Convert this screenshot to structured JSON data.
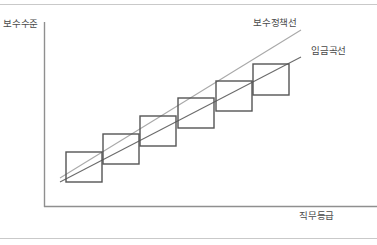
{
  "figure": {
    "axes": {
      "y_axis_title": "보수수준",
      "x_axis_title": "직무등급"
    },
    "annotations": {
      "policy_line_label": "보수정책선",
      "wage_curve_label": "임금곡선"
    },
    "colors": {
      "axis": "#8f8f8f",
      "policy_line": "#a9a9a9",
      "wage_curve": "#6b6b6b",
      "grade_box": "#555555",
      "page_rule": "#c9c9c9",
      "text": "#4a4a4a",
      "background": "#ffffff"
    }
  },
  "chart_data": {
    "type": "scatter",
    "title": "",
    "xlabel": "직무등급",
    "ylabel": "보수수준",
    "grid": false,
    "legend_position": "inline-annotation",
    "xlim": [
      0,
      10
    ],
    "ylim": [
      0,
      10
    ],
    "annotations": [
      "보수정책선",
      "임금곡선"
    ],
    "series": [
      {
        "name": "보수정책선",
        "type": "line",
        "color": "#a9a9a9",
        "x": [
          0.55,
          8.65
        ],
        "y": [
          2.05,
          8.55
        ],
        "pixel_endpoints": [
          [
            60,
            178
          ],
          [
            301,
            30
          ]
        ]
      },
      {
        "name": "임금곡선",
        "type": "line",
        "color": "#6b6b6b",
        "x": [
          0.55,
          8.65
        ],
        "y": [
          1.55,
          7.3
        ],
        "pixel_endpoints": [
          [
            60,
            182
          ],
          [
            301,
            57
          ]
        ]
      },
      {
        "name": "직무등급 보수범위 (grade pay ranges)",
        "type": "boxes",
        "color": "#555555",
        "boxes": [
          {
            "grade": 1,
            "x": 66,
            "y": 152,
            "w": 36,
            "h": 30
          },
          {
            "grade": 2,
            "x": 103,
            "y": 134,
            "w": 36,
            "h": 30
          },
          {
            "grade": 3,
            "x": 140,
            "y": 116,
            "w": 36,
            "h": 30
          },
          {
            "grade": 4,
            "x": 178,
            "y": 98,
            "w": 36,
            "h": 30
          },
          {
            "grade": 5,
            "x": 216,
            "y": 81,
            "w": 36,
            "h": 30
          },
          {
            "grade": 6,
            "x": 253,
            "y": 64,
            "w": 36,
            "h": 31
          }
        ]
      }
    ],
    "axis_geometry": {
      "origin": [
        44,
        207
      ],
      "y_axis_top": [
        44,
        22
      ],
      "x_axis_right": [
        377,
        207
      ]
    }
  }
}
